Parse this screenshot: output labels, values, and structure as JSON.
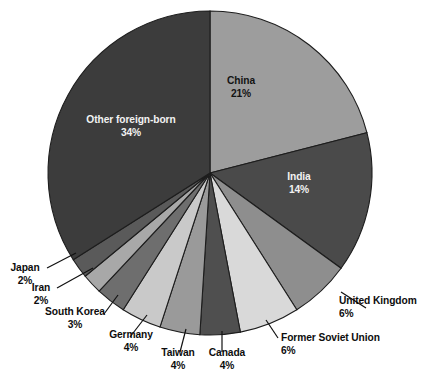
{
  "chart_data": {
    "type": "pie",
    "title": "",
    "subtitle": "",
    "xlabel": "",
    "ylabel": "",
    "legend_position": "none",
    "grid": false,
    "units": "percent",
    "start_angle_deg": 0,
    "direction": "clockwise",
    "categories": [
      "China",
      "India",
      "United Kingdom",
      "Former Soviet Union",
      "Canada",
      "Taiwan",
      "Germany",
      "South Korea",
      "Iran",
      "Japan",
      "Other foreign-born"
    ],
    "values": [
      21,
      14,
      6,
      6,
      4,
      4,
      4,
      3,
      2,
      2,
      34
    ],
    "value_labels": [
      "21%",
      "14%",
      "6%",
      "6%",
      "4%",
      "4%",
      "4%",
      "3%",
      "2%",
      "2%",
      "34%"
    ],
    "colors": [
      "#9d9d9d",
      "#4a4a4a",
      "#8e8e8e",
      "#d9d9d9",
      "#4f4f4f",
      "#9a9a9a",
      "#c9c9c9",
      "#6e6e6e",
      "#a8a8a8",
      "#5a5a5a",
      "#3c3c3c"
    ],
    "slices": [
      {
        "label": "China",
        "value": 21,
        "value_label": "21%",
        "color": "#9d9d9d",
        "label_placement": "inside",
        "label_color": "#131313"
      },
      {
        "label": "India",
        "value": 14,
        "value_label": "14%",
        "color": "#4a4a4a",
        "label_placement": "inside",
        "label_color": "#f2f2f2"
      },
      {
        "label": "United Kingdom",
        "value": 6,
        "value_label": "6%",
        "color": "#8e8e8e",
        "label_placement": "outside",
        "label_color": "#0d0d0d"
      },
      {
        "label": "Former Soviet Union",
        "value": 6,
        "value_label": "6%",
        "color": "#d9d9d9",
        "label_placement": "outside",
        "label_color": "#0d0d0d"
      },
      {
        "label": "Canada",
        "value": 4,
        "value_label": "4%",
        "color": "#4f4f4f",
        "label_placement": "outside",
        "label_color": "#0d0d0d"
      },
      {
        "label": "Taiwan",
        "value": 4,
        "value_label": "4%",
        "color": "#9a9a9a",
        "label_placement": "outside",
        "label_color": "#0d0d0d"
      },
      {
        "label": "Germany",
        "value": 4,
        "value_label": "4%",
        "color": "#c9c9c9",
        "label_placement": "outside",
        "label_color": "#0d0d0d"
      },
      {
        "label": "South Korea",
        "value": 3,
        "value_label": "3%",
        "color": "#6e6e6e",
        "label_placement": "outside",
        "label_color": "#0d0d0d"
      },
      {
        "label": "Iran",
        "value": 2,
        "value_label": "2%",
        "color": "#a8a8a8",
        "label_placement": "outside",
        "label_color": "#0d0d0d"
      },
      {
        "label": "Japan",
        "value": 2,
        "value_label": "2%",
        "color": "#5a5a5a",
        "label_placement": "outside",
        "label_color": "#0d0d0d"
      },
      {
        "label": "Other foreign-born",
        "value": 34,
        "value_label": "34%",
        "color": "#3c3c3c",
        "label_placement": "inside",
        "label_color": "#f2f2f2"
      }
    ]
  },
  "geometry": {
    "center_x": 210,
    "center_y": 173,
    "radius": 162
  },
  "style": {
    "background": "#ffffff",
    "slice_border": "#1d1d1d",
    "leader_line": "#111111"
  },
  "labels": {
    "china": {
      "name": "China",
      "pct": "21%"
    },
    "india": {
      "name": "India",
      "pct": "14%"
    },
    "other": {
      "name": "Other foreign-born",
      "pct": "34%"
    },
    "uk": {
      "name": "United Kingdom",
      "pct": "6%"
    },
    "fsu": {
      "name": "Former Soviet Union",
      "pct": "6%"
    },
    "canada": {
      "name": "Canada",
      "pct": "4%"
    },
    "taiwan": {
      "name": "Taiwan",
      "pct": "4%"
    },
    "germany": {
      "name": "Germany",
      "pct": "4%"
    },
    "southkorea": {
      "name": "South Korea",
      "pct": "3%"
    },
    "iran": {
      "name": "Iran",
      "pct": "2%"
    },
    "japan": {
      "name": "Japan",
      "pct": "2%"
    }
  }
}
